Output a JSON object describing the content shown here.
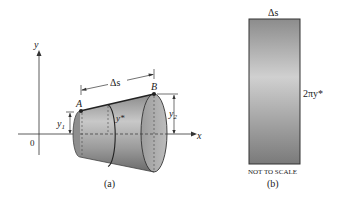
{
  "figure_a": {
    "caption": "(a)",
    "axis_x_label": "x",
    "axis_y_label": "y",
    "origin_label": "0",
    "point_a": "A",
    "point_b": "B",
    "arc_length_label": "Δs",
    "y1_label": "y",
    "y1_sub": "1",
    "y2_label": "y",
    "y2_sub": "2",
    "ystar_label": "y*"
  },
  "figure_b": {
    "caption": "(b)",
    "width_label": "Δs",
    "height_label": "2πy*",
    "note": "NOT TO SCALE"
  },
  "colors": {
    "surface_dark": "#6f6f6f",
    "surface_light": "#c9c9c9",
    "line": "#222222"
  }
}
